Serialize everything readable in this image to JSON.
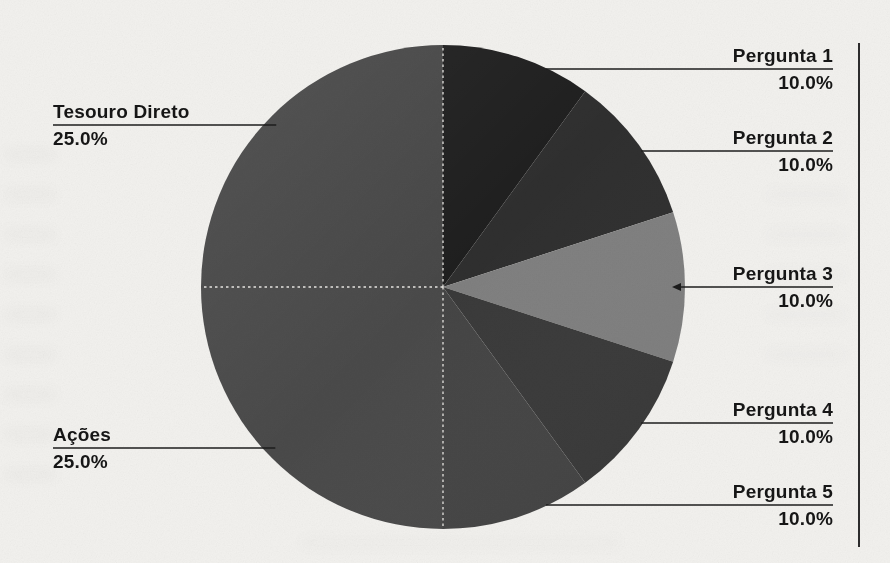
{
  "page": {
    "background": "#f2f1ee",
    "text_color": "#161616",
    "page_edge_color": "#2c2c2c"
  },
  "chart_data": {
    "type": "pie",
    "title": "",
    "direction": "clockwise",
    "start_angle_deg": 0,
    "total": 100,
    "segments": [
      {
        "label": "Pergunta 1",
        "value": 10.0,
        "pct_label": "10.0%",
        "color": "#1f1f1f",
        "side": "right",
        "callout_y": 69,
        "arrow": false
      },
      {
        "label": "Pergunta 2",
        "value": 10.0,
        "pct_label": "10.0%",
        "color": "#2f2f2f",
        "side": "right",
        "callout_y": 151,
        "arrow": false
      },
      {
        "label": "Pergunta 3",
        "value": 10.0,
        "pct_label": "10.0%",
        "color": "#808080",
        "side": "right",
        "callout_y": 287,
        "arrow": true
      },
      {
        "label": "Pergunta 4",
        "value": 10.0,
        "pct_label": "10.0%",
        "color": "#3a3a3a",
        "side": "right",
        "callout_y": 423,
        "arrow": false
      },
      {
        "label": "Pergunta 5",
        "value": 10.0,
        "pct_label": "10.0%",
        "color": "#454545",
        "side": "right",
        "callout_y": 505,
        "arrow": false
      },
      {
        "label": "Ações",
        "value": 25.0,
        "pct_label": "25.0%",
        "color": "#4a4a4a",
        "side": "left",
        "callout_y": 448,
        "arrow": false
      },
      {
        "label": "Tesouro Direto",
        "value": 25.0,
        "pct_label": "25.0%",
        "color": "#484848",
        "side": "left",
        "callout_y": 125,
        "arrow": false
      }
    ],
    "layout": {
      "center_x": 443,
      "center_y": 287,
      "radius": 242,
      "left_label_x": 53,
      "right_label_x": 833,
      "divider_angles_deg": [
        0,
        180,
        270
      ],
      "page_edge_line": {
        "x": 858,
        "y1": 43,
        "y2": 547
      }
    },
    "leader_line_color": "#1c1c1c",
    "divider_color": "#e9e7e3",
    "legend_position": "callouts",
    "grid": false
  }
}
